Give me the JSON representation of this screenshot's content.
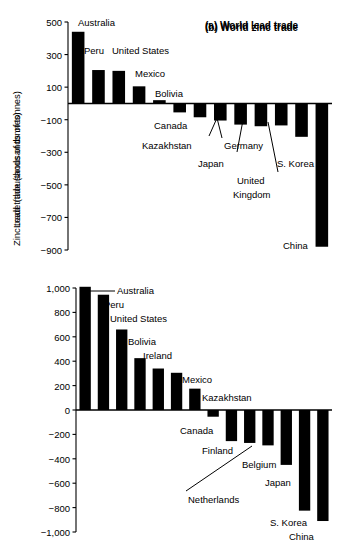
{
  "figure": {
    "width": 344,
    "height": 550,
    "background": "#ffffff",
    "bar_color": "#000000",
    "axis_color": "#000000"
  },
  "chart_data": [
    {
      "type": "bar",
      "panel": "a",
      "title": "(a) World lead trade",
      "xlabel": "",
      "ylabel": "Lead trade (thousands of tonnes)",
      "ylim": [
        -900,
        500
      ],
      "yticks": [
        500,
        300,
        100,
        -100,
        -300,
        -500,
        -700,
        -900
      ],
      "ytick_labels": [
        "500",
        "300",
        "100",
        "−100",
        "−300",
        "−500",
        "−700",
        "−900"
      ],
      "grid": false,
      "legend": "none",
      "categories": [
        "Australia",
        "Peru",
        "United States",
        "Mexico",
        "Bolivia",
        "Canada",
        "Kazakhstan",
        "Germany",
        "Japan",
        "United Kingdom",
        "S. Korea",
        "",
        "China"
      ],
      "values": [
        440,
        205,
        200,
        105,
        20,
        -55,
        -85,
        -105,
        -130,
        -140,
        -135,
        -205,
        -880
      ],
      "annotations": [
        {
          "text": "Australia",
          "x": 78,
          "y": 17,
          "leader": null
        },
        {
          "text": "Peru",
          "x": 84,
          "y": 45,
          "leader": null
        },
        {
          "text": "United States",
          "x": 112,
          "y": 45,
          "leader": null
        },
        {
          "text": "Mexico",
          "x": 135,
          "y": 68,
          "leader": null
        },
        {
          "text": "Bolivia",
          "x": 155,
          "y": 88,
          "leader": null
        },
        {
          "text": "Canada",
          "x": 154,
          "y": 120,
          "leader": null
        },
        {
          "text": "Kazakhstan",
          "x": 142,
          "y": 140,
          "leader": {
            "x1": 209,
            "y1": 136,
            "x2": 217,
            "y2": 118
          }
        },
        {
          "text": "Germany",
          "x": 224,
          "y": 140,
          "leader": {
            "x1": 222,
            "y1": 138,
            "x2": 217,
            "y2": 118
          }
        },
        {
          "text": "Japan",
          "x": 198,
          "y": 158,
          "leader": {
            "x1": 237,
            "y1": 152,
            "x2": 243,
            "y2": 120
          }
        },
        {
          "text": "United",
          "x": 237,
          "y": 175,
          "leader": null
        },
        {
          "text": "Kingdom",
          "x": 233,
          "y": 189,
          "leader": {
            "x1": 278,
            "y1": 172,
            "x2": 268,
            "y2": 122
          }
        },
        {
          "text": "S. Korea",
          "x": 277,
          "y": 158,
          "leader": null
        },
        {
          "text": "China",
          "x": 283,
          "y": 240,
          "leader": null
        }
      ]
    },
    {
      "type": "bar",
      "panel": "b",
      "title": "(b) World zinc trade",
      "xlabel": "",
      "ylabel": "Zinc trade (thousands of tonnes)",
      "ylim": [
        -1000,
        1000
      ],
      "yticks": [
        1000,
        800,
        600,
        400,
        200,
        0,
        -200,
        -400,
        -600,
        -800,
        -1000
      ],
      "ytick_labels": [
        "1,000",
        "800",
        "600",
        "400",
        "200",
        "0",
        "−200",
        "−400",
        "−600",
        "−800",
        "−1,000"
      ],
      "grid": false,
      "legend": "none",
      "categories": [
        "Australia",
        "Peru",
        "United States",
        "Bolivia",
        "Ireland",
        "Mexico",
        "Kazakhstan",
        "Canada",
        "Finland",
        "Netherlands",
        "Belgium",
        "Japan",
        "S. Korea",
        "China"
      ],
      "values": [
        1010,
        945,
        660,
        425,
        340,
        305,
        175,
        -55,
        -255,
        -270,
        -290,
        -450,
        -825,
        -910
      ],
      "annotations": [
        {
          "text": "Australia",
          "x": 117,
          "y": 285,
          "leader": {
            "x1": 115,
            "y1": 291,
            "x2": 85,
            "y2": 291
          }
        },
        {
          "text": "Peru",
          "x": 104,
          "y": 299,
          "leader": null
        },
        {
          "text": "United States",
          "x": 110,
          "y": 313,
          "leader": null
        },
        {
          "text": "Bolivia",
          "x": 128,
          "y": 336,
          "leader": null
        },
        {
          "text": "Ireland",
          "x": 143,
          "y": 350,
          "leader": null
        },
        {
          "text": "Mexico",
          "x": 182,
          "y": 374,
          "leader": null
        },
        {
          "text": "Kazakhstan",
          "x": 202,
          "y": 392,
          "leader": null
        },
        {
          "text": "Canada",
          "x": 180,
          "y": 425,
          "leader": null
        },
        {
          "text": "Finland",
          "x": 202,
          "y": 445,
          "leader": null
        },
        {
          "text": "Belgium",
          "x": 242,
          "y": 459,
          "leader": null
        },
        {
          "text": "Japan",
          "x": 265,
          "y": 477,
          "leader": null
        },
        {
          "text": "Netherlands",
          "x": 188,
          "y": 494,
          "leader": {
            "x1": 186,
            "y1": 491,
            "x2": 252,
            "y2": 446
          }
        },
        {
          "text": "S. Korea",
          "x": 270,
          "y": 517,
          "leader": null
        },
        {
          "text": "China",
          "x": 289,
          "y": 531,
          "leader": null
        }
      ]
    }
  ]
}
